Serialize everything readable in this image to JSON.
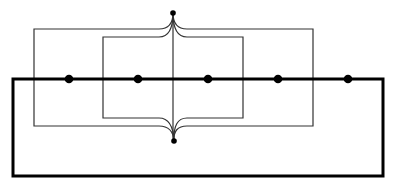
{
  "diagram": {
    "background": "#ffffff",
    "stroke_color": "#000000",
    "thin_color": "#333333",
    "top_node": {
      "x": 173,
      "y": 13
    },
    "bottom_node": {
      "x": 174,
      "y": 141
    },
    "center_line_x": 173,
    "outer_rect": {
      "left": 34,
      "right": 313,
      "top": 29,
      "bottom": 126
    },
    "inner_rect": {
      "left": 103,
      "right": 243,
      "top": 37,
      "bottom": 118
    },
    "thick_loop": {
      "left": 13,
      "right": 383,
      "top": 79,
      "bottom": 176
    },
    "line_nodes_x": [
      69,
      138,
      208,
      278,
      348
    ]
  }
}
